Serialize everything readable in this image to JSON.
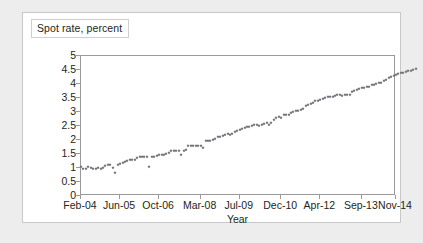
{
  "chart_data": {
    "type": "scatter",
    "title": "Spot rate, percent",
    "xlabel": "Year",
    "ylabel": "",
    "ylim": [
      0,
      5
    ],
    "ytick_labels": [
      "5",
      "4.5",
      "4",
      "3.5",
      "3",
      "2.5",
      "2",
      "1.5",
      "1",
      "0.5",
      "0"
    ],
    "ytick_values": [
      5,
      4.5,
      4,
      3.5,
      3,
      2.5,
      2,
      1.5,
      1,
      0.5,
      0
    ],
    "xtick_labels": [
      "Feb-04",
      "Jun-05",
      "Oct-06",
      "Mar-08",
      "Jul-09",
      "Dec-10",
      "Apr-12",
      "Sep-13",
      "Nov-14"
    ],
    "xtick_indices": [
      0,
      16,
      32,
      49,
      65,
      82,
      98,
      115,
      129
    ],
    "xlim_index": [
      0,
      129
    ],
    "grid": false,
    "legend": null,
    "marker": "diamond",
    "marker_color": "#6f6f76",
    "x": [
      "Feb-04",
      "Mar-04",
      "Apr-04",
      "May-04",
      "Jun-04",
      "Jul-04",
      "Aug-04",
      "Sep-04",
      "Oct-04",
      "Nov-04",
      "Dec-04",
      "Jan-05",
      "Feb-05",
      "Mar-05",
      "Apr-05",
      "May-05",
      "Jun-05",
      "Jul-05",
      "Aug-05",
      "Sep-05",
      "Oct-05",
      "Nov-05",
      "Dec-05",
      "Jan-06",
      "Feb-06",
      "Mar-06",
      "Apr-06",
      "May-06",
      "Jun-06",
      "Jul-06",
      "Aug-06",
      "Sep-06",
      "Oct-06",
      "Nov-06",
      "Dec-06",
      "Jan-07",
      "Feb-07",
      "Mar-07",
      "Apr-07",
      "May-07",
      "Jun-07",
      "Jul-07",
      "Aug-07",
      "Sep-07",
      "Oct-07",
      "Nov-07",
      "Dec-07",
      "Jan-08",
      "Feb-08",
      "Mar-08",
      "Apr-08",
      "May-08",
      "Jun-08",
      "Jul-08",
      "Aug-08",
      "Sep-08",
      "Oct-08",
      "Nov-08",
      "Dec-08",
      "Jan-09",
      "Feb-09",
      "Mar-09",
      "Apr-09",
      "May-09",
      "Jun-09",
      "Jul-09",
      "Aug-09",
      "Sep-09",
      "Oct-09",
      "Nov-09",
      "Dec-09",
      "Jan-10",
      "Feb-10",
      "Mar-10",
      "Apr-10",
      "May-10",
      "Jun-10",
      "Jul-10",
      "Aug-10",
      "Sep-10",
      "Oct-10",
      "Nov-10",
      "Dec-10",
      "Jan-11",
      "Feb-11",
      "Mar-11",
      "Apr-11",
      "May-11",
      "Jun-11",
      "Jul-11",
      "Aug-11",
      "Sep-11",
      "Oct-11",
      "Nov-11",
      "Dec-11",
      "Jan-12",
      "Feb-12",
      "Mar-12",
      "Apr-12",
      "May-12",
      "Jun-12",
      "Jul-12",
      "Aug-12",
      "Sep-12",
      "Oct-12",
      "Nov-12",
      "Dec-12",
      "Jan-13",
      "Feb-13",
      "Mar-13",
      "Apr-13",
      "May-13",
      "Jun-13",
      "Jul-13",
      "Aug-13",
      "Sep-13",
      "Oct-13",
      "Nov-13",
      "Dec-13",
      "Jan-14",
      "Feb-14",
      "Mar-14",
      "Apr-14",
      "May-14",
      "Jun-14",
      "Jul-14",
      "Aug-14",
      "Sep-14",
      "Oct-14",
      "Nov-14"
    ],
    "y": [
      1.02,
      0.95,
      0.98,
      1.02,
      1.0,
      0.98,
      0.97,
      1.0,
      0.98,
      1.0,
      1.08,
      1.12,
      1.1,
      1.0,
      0.82,
      1.1,
      1.15,
      1.18,
      1.22,
      1.25,
      1.28,
      1.3,
      1.3,
      1.35,
      1.38,
      1.38,
      1.38,
      1.4,
      1.05,
      1.38,
      1.4,
      1.42,
      1.45,
      1.48,
      1.48,
      1.5,
      1.52,
      1.62,
      1.62,
      1.62,
      1.62,
      1.48,
      1.62,
      1.65,
      1.78,
      1.8,
      1.8,
      1.78,
      1.8,
      1.8,
      1.72,
      1.95,
      1.98,
      1.98,
      2.0,
      2.05,
      2.1,
      2.12,
      2.15,
      2.18,
      2.2,
      2.18,
      2.2,
      2.3,
      2.32,
      2.35,
      2.4,
      2.42,
      2.45,
      2.48,
      2.5,
      2.52,
      2.52,
      2.5,
      2.55,
      2.58,
      2.6,
      2.52,
      2.62,
      2.72,
      2.78,
      2.82,
      2.78,
      2.88,
      2.9,
      2.9,
      2.95,
      3.0,
      3.05,
      3.02,
      3.08,
      3.12,
      3.2,
      3.25,
      3.3,
      3.32,
      3.38,
      3.4,
      3.42,
      3.45,
      3.5,
      3.52,
      3.52,
      3.55,
      3.58,
      3.6,
      3.6,
      3.58,
      3.62,
      3.62,
      3.62,
      3.7,
      3.75,
      3.78,
      3.82,
      3.85,
      3.85,
      3.88,
      3.88,
      3.95,
      3.98,
      4.0,
      4.05,
      4.02,
      4.1,
      4.15,
      4.2,
      4.25,
      4.3,
      4.32,
      4.35,
      4.38,
      4.4,
      4.42,
      4.45,
      4.48,
      4.5,
      4.52
    ]
  }
}
